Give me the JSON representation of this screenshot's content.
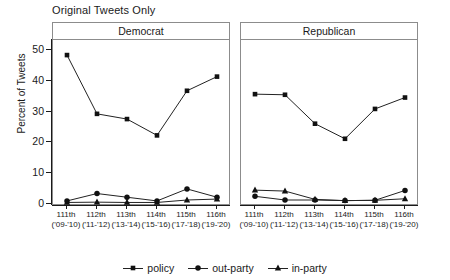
{
  "chart_data": {
    "type": "line",
    "title": "Original Tweets Only",
    "xlabel": "",
    "ylabel": "Percent of Tweets",
    "ylim": [
      0,
      52
    ],
    "yticks": [
      0,
      10,
      20,
      30,
      40,
      50
    ],
    "grid": false,
    "legend_position": "bottom",
    "facet_variable": "party",
    "categories": [
      {
        "line1": "111th",
        "line2": "('09-'10)"
      },
      {
        "line1": "112th",
        "line2": "('11-'12)"
      },
      {
        "line1": "113th",
        "line2": "('13-'14)"
      },
      {
        "line1": "114th",
        "line2": "('15-'16)"
      },
      {
        "line1": "115th",
        "line2": "('17-'18)"
      },
      {
        "line1": "116th",
        "line2": "('19-'20)"
      }
    ],
    "panels": [
      {
        "label": "Democrat",
        "series": [
          {
            "name": "policy",
            "marker": "square",
            "values": [
              48.4,
              29.3,
              27.6,
              22.3,
              36.8,
              41.4
            ]
          },
          {
            "name": "out-party",
            "marker": "circle",
            "values": [
              1.0,
              3.4,
              2.2,
              1.0,
              4.9,
              2.2
            ]
          },
          {
            "name": "in-party",
            "marker": "triangle",
            "values": [
              0.5,
              0.6,
              0.5,
              0.5,
              1.3,
              1.6
            ]
          }
        ]
      },
      {
        "label": "Republican",
        "series": [
          {
            "name": "policy",
            "marker": "square",
            "values": [
              35.7,
              35.5,
              26.1,
              21.2,
              30.9,
              34.6
            ]
          },
          {
            "name": "out-party",
            "marker": "circle",
            "values": [
              2.5,
              1.3,
              1.3,
              1.1,
              1.2,
              4.4
            ]
          },
          {
            "name": "in-party",
            "marker": "triangle",
            "values": [
              4.5,
              4.2,
              1.5,
              1.1,
              1.2,
              1.7
            ]
          }
        ]
      }
    ],
    "legend": [
      {
        "label": "policy",
        "marker": "square"
      },
      {
        "label": "out-party",
        "marker": "circle"
      },
      {
        "label": "in-party",
        "marker": "triangle"
      }
    ],
    "colors": {
      "line": "#222222",
      "marker": "#111111",
      "axis": "#1a1a1a",
      "panel_border": "#8c8c8c",
      "background": "#ffffff"
    }
  }
}
